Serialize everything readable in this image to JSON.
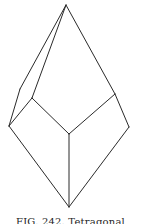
{
  "figure": {
    "caption": "FIG. 242. Tetragonal",
    "stroke_color": "#2a2a2a",
    "vertices": {
      "apex": [
        66,
        5
      ],
      "upper_left_outer": [
        20,
        89
      ],
      "upper_left_inner": [
        32,
        98
      ],
      "left": [
        9,
        126
      ],
      "upper_right": [
        115,
        94
      ],
      "right": [
        129,
        127
      ],
      "center": [
        69,
        134
      ],
      "bottom": [
        69,
        207
      ]
    },
    "edges": [
      [
        "apex",
        "upper_left_outer"
      ],
      [
        "apex",
        "upper_left_inner"
      ],
      [
        "apex",
        "upper_right"
      ],
      [
        "upper_left_outer",
        "left"
      ],
      [
        "upper_left_inner",
        "left"
      ],
      [
        "upper_left_inner",
        "center"
      ],
      [
        "upper_right",
        "center"
      ],
      [
        "upper_right",
        "right"
      ],
      [
        "center",
        "bottom"
      ],
      [
        "left",
        "bottom"
      ],
      [
        "right",
        "bottom"
      ]
    ]
  }
}
